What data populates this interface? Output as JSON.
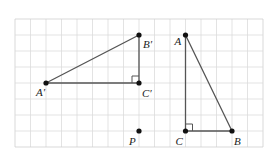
{
  "diagram": {
    "type": "grid-transformation",
    "grid": {
      "left": 15,
      "top": 19,
      "cols": 16,
      "rows": 8,
      "cell_w": 15.5,
      "cell_h": 16,
      "line_color": "#dcdcdc",
      "border_color": "#cfcfcf"
    },
    "colors": {
      "segment": "#555555",
      "point": "#111111",
      "label": "#222222"
    },
    "points": [
      {
        "id": "A1",
        "label": "A′",
        "col": 2,
        "row": 4,
        "dx": -10,
        "dy": 13
      },
      {
        "id": "B1",
        "label": "B′",
        "col": 8,
        "row": 1,
        "dx": 4,
        "dy": 13
      },
      {
        "id": "C1",
        "label": "C′",
        "col": 8,
        "row": 4,
        "dx": 3,
        "dy": 14
      },
      {
        "id": "P",
        "label": "P",
        "col": 8,
        "row": 7,
        "dx": -10,
        "dy": 14
      },
      {
        "id": "A",
        "label": "A",
        "col": 11,
        "row": 1,
        "dx": -11,
        "dy": 10
      },
      {
        "id": "C",
        "label": "C",
        "col": 11,
        "row": 7,
        "dx": -10,
        "dy": 14
      },
      {
        "id": "B",
        "label": "B",
        "col": 14,
        "row": 7,
        "dx": 2,
        "dy": 14
      }
    ],
    "triangles": [
      {
        "name": "A′B′C′",
        "vertices": [
          "A1",
          "B1",
          "C1"
        ],
        "right_angle_at": "C1",
        "right_angle_dir": [
          -1,
          -1
        ]
      },
      {
        "name": "ABC",
        "vertices": [
          "A",
          "B",
          "C"
        ],
        "right_angle_at": "C",
        "right_angle_dir": [
          1,
          -1
        ]
      }
    ]
  }
}
